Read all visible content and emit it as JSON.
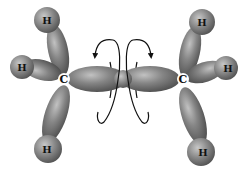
{
  "diagram": {
    "atoms": {
      "left_carbon": "C",
      "right_carbon": "C",
      "left_h_top": "H",
      "left_h_mid": "H",
      "left_h_bottom": "H",
      "right_h_top": "H",
      "right_h_mid": "H",
      "right_h_bottom": "H"
    },
    "colors": {
      "orbital": "#7d7d7d",
      "orbital_highlight": "#bdbdbd",
      "orbital_shadow": "#4a4a4a",
      "arrow": "#111111",
      "background": "#ffffff"
    }
  }
}
